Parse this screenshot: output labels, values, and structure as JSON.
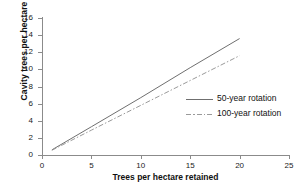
{
  "chart_data": {
    "type": "line",
    "title": "",
    "xlabel": "Trees per hectare retained",
    "ylabel": "Cavity trees per hectare",
    "xlim": [
      0,
      25
    ],
    "ylim": [
      0,
      16
    ],
    "xticks": [
      "0",
      "5",
      "10",
      "15",
      "20",
      "25"
    ],
    "yticks": [
      "0",
      "2",
      "4",
      "6",
      "8",
      "10",
      "12",
      "14",
      "16"
    ],
    "grid": false,
    "legend_position": "center-right",
    "series": [
      {
        "name": "50-year rotation",
        "style": "solid",
        "color": "#6f6f6f",
        "x": [
          1,
          5,
          10,
          15,
          20
        ],
        "values": [
          0.6,
          3.3,
          6.7,
          10.2,
          13.6
        ]
      },
      {
        "name": "100-year rotation",
        "style": "dash-dot",
        "color": "#9a9a9a",
        "x": [
          1,
          5,
          10,
          15,
          20
        ],
        "values": [
          0.55,
          2.9,
          5.8,
          8.7,
          11.6
        ]
      }
    ]
  },
  "legend": {
    "items": [
      {
        "label": "50-year rotation"
      },
      {
        "label": "100-year rotation"
      }
    ]
  },
  "axes": {
    "x_title": "Trees per hectare retained",
    "y_title": "Cavity trees per hectare",
    "x_tick_labels": [
      "0",
      "5",
      "10",
      "15",
      "20",
      "25"
    ],
    "y_tick_labels": [
      "0",
      "2",
      "4",
      "6",
      "8",
      "10",
      "12",
      "14",
      "16"
    ]
  },
  "colors": {
    "axis": "#8b8b8b",
    "series_50": "#6f6f6f",
    "series_100": "#9a9a9a",
    "text": "#111111",
    "background": "#ffffff"
  }
}
